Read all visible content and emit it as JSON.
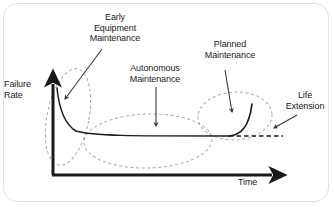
{
  "diagram": {
    "type": "bathtub-curve",
    "title": "",
    "axes": {
      "y_label": "Failure\nRate",
      "x_label": "Time",
      "y_axis_name": "y-axis-arrow",
      "x_axis_name": "x-axis-arrow"
    },
    "annotations": [
      {
        "id": "early-equipment-maintenance",
        "label": "Early\nEquipment\nMaintenance",
        "has_arrow": true,
        "arrow_direction": "down-left",
        "points_to": "infant-mortality-region"
      },
      {
        "id": "autonomous-maintenance",
        "label": "Autonomous\nMaintenance",
        "has_arrow": true,
        "arrow_direction": "down",
        "points_to": "useful-life-region"
      },
      {
        "id": "planned-maintenance",
        "label": "Planned\nMaintenance",
        "has_arrow": true,
        "arrow_direction": "down",
        "points_to": "wear-out-region"
      },
      {
        "id": "life-extension",
        "label": "Life\nExtension",
        "has_arrow": true,
        "arrow_direction": "down-left",
        "points_to": "extended-flat-dashed-line"
      }
    ],
    "regions": [
      {
        "id": "infant-mortality-region",
        "shape": "ellipse",
        "orientation": "tall-tilted",
        "style": "dashed"
      },
      {
        "id": "useful-life-region",
        "shape": "ellipse",
        "orientation": "wide-flat",
        "style": "dashed"
      },
      {
        "id": "wear-out-region",
        "shape": "ellipse",
        "orientation": "rounded",
        "style": "dashed"
      }
    ],
    "curves": [
      {
        "id": "failure-rate-curve",
        "style": "solid",
        "color": "#1a1a1a",
        "description": "bathtub curve: steep decline, long flat plateau, sharp rise"
      },
      {
        "id": "life-extension-line",
        "style": "dashed",
        "color": "#1a1a1a",
        "description": "flat dashed continuation beyond the wear-out rise"
      }
    ],
    "colors": {
      "ink": "#1a1a1a",
      "ellipse_stroke": "#9a9a9a",
      "frame_border": "#e2e2e2",
      "background": "#ffffff"
    }
  }
}
